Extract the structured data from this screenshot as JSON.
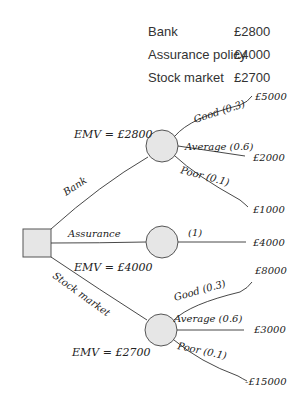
{
  "summary_table": {
    "rows": [
      {
        "option": "Bank",
        "value": "£2800"
      },
      {
        "option": "Assurance policy",
        "value": "£4000"
      },
      {
        "option": "Stock market",
        "value": "£2700"
      }
    ]
  },
  "tree": {
    "decision_node": "decision",
    "branches": [
      {
        "label": "Bank",
        "emv": "EMV = £2800",
        "outcomes": [
          {
            "label": "Good (0.3)",
            "payoff": "£5000"
          },
          {
            "label": "Average (0.6)",
            "payoff": "£2000"
          },
          {
            "label": "Poor (0.1)",
            "payoff": "£1000"
          }
        ]
      },
      {
        "label": "Assurance",
        "emv": "EMV = £4000",
        "outcomes": [
          {
            "label": "(1)",
            "payoff": "£4000"
          }
        ]
      },
      {
        "label": "Stock market",
        "emv": "EMV = £2700",
        "outcomes": [
          {
            "label": "Good (0.3)",
            "payoff": "£8000"
          },
          {
            "label": "Average (0.6)",
            "payoff": "£3000"
          },
          {
            "label": "Poor (0.1)",
            "payoff": "-£15000"
          }
        ]
      }
    ]
  },
  "colors": {
    "line": "#333333",
    "node_fill": "#e6e6e6",
    "node_stroke": "#555555"
  }
}
